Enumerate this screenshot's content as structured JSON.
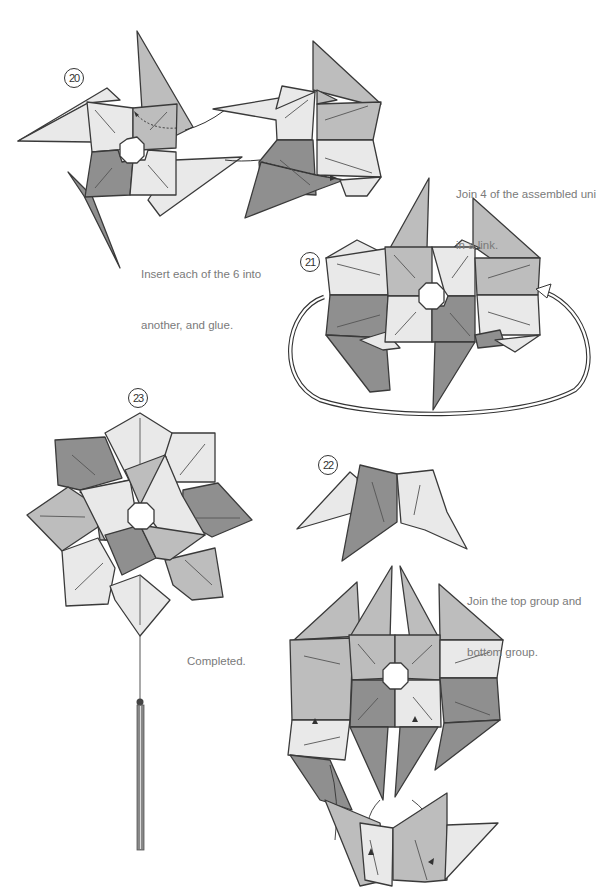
{
  "steps": [
    {
      "number": "20",
      "caption_line1": "Insert each of the 6 into",
      "caption_line2": "another, and glue."
    },
    {
      "number": "21",
      "caption_line1": "Join 4 of the assembled uni",
      "caption_line2": "in a link."
    },
    {
      "number": "22",
      "caption_line1": "Join the top group and",
      "caption_line2": "bottom group."
    },
    {
      "number": "23",
      "caption_line1": "Completed.",
      "caption_line2": ""
    }
  ],
  "colors": {
    "light": "#e9e9e9",
    "medium": "#bdbdbd",
    "dark": "#8f8f8f",
    "line": "#3a3a3a",
    "caption": "#7a7a7a"
  }
}
